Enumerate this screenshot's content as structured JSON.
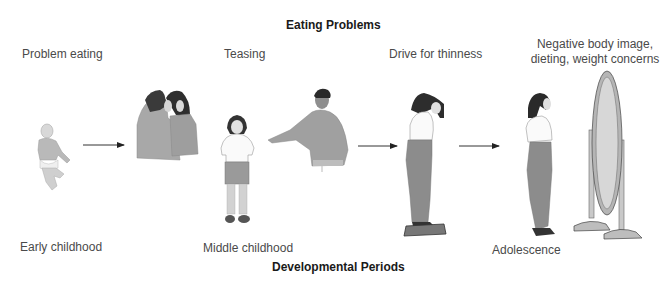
{
  "diagram": {
    "top_title": "Eating Problems",
    "bottom_title": "Developmental Periods",
    "problems": [
      {
        "label": "Problem eating"
      },
      {
        "label": "Teasing"
      },
      {
        "label": "Drive for thinness"
      },
      {
        "label_line1": "Negative body image,",
        "label_line2": "dieting, weight concerns"
      }
    ],
    "periods": [
      {
        "label": "Early childhood"
      },
      {
        "label": "Middle childhood"
      },
      {
        "label": "Adolescence"
      }
    ],
    "arrows": [
      {
        "from": "Problem eating",
        "to": "Teasing"
      },
      {
        "from": "Teasing",
        "to": "Drive for thinness"
      },
      {
        "from": "Drive for thinness",
        "to": "Negative body image, dieting, weight concerns"
      }
    ],
    "illustrations": [
      {
        "name": "infant",
        "stage": "Early childhood"
      },
      {
        "name": "two-girls-whispering",
        "stage": "Middle childhood"
      },
      {
        "name": "girl-standing",
        "stage": "Middle childhood"
      },
      {
        "name": "man-pointing",
        "stage": "Middle childhood"
      },
      {
        "name": "girl-on-scale",
        "stage": "Adolescence"
      },
      {
        "name": "girl-at-mirror",
        "stage": "Adolescence"
      },
      {
        "name": "standing-mirror",
        "stage": "Adolescence"
      }
    ]
  }
}
